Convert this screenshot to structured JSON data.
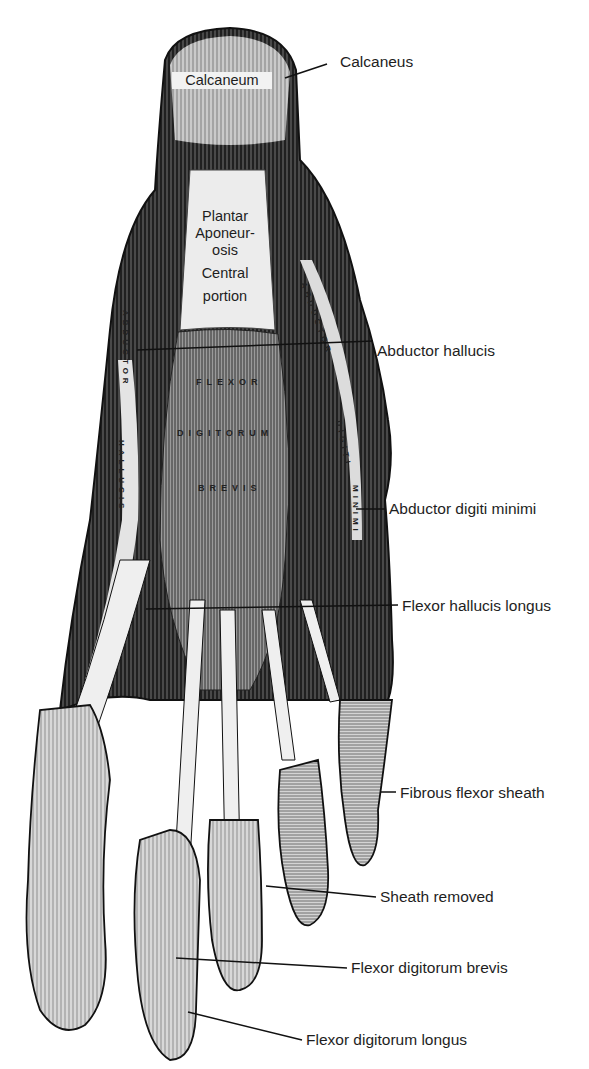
{
  "figure": {
    "style": "monochrome engraving",
    "colors": {
      "ink": "#1a1a1a",
      "paper": "#ffffff",
      "muscle_dark": "#2b2b2b",
      "tendon_light": "#e8e8e8"
    }
  },
  "external_labels": [
    {
      "id": "calcaneus",
      "text": "Calcaneus",
      "x": 380,
      "y": 53,
      "line": [
        [
          285,
          78
        ],
        [
          327,
          64
        ]
      ]
    },
    {
      "id": "abductor-hallucis",
      "text": "Abductor hallucis",
      "x": 377,
      "y": 342,
      "line": [
        [
          137,
          350
        ],
        [
          373,
          341
        ]
      ]
    },
    {
      "id": "abductor-digiti-minimi",
      "text": "Abductor digiti minimi",
      "x": 389,
      "y": 500,
      "line": [
        [
          356,
          509
        ],
        [
          385,
          509
        ]
      ]
    },
    {
      "id": "flexor-hallucis-longus",
      "text": "Flexor hallucis longus",
      "x": 402,
      "y": 597,
      "line": [
        [
          146,
          609
        ],
        [
          398,
          605
        ]
      ]
    },
    {
      "id": "fibrous-flexor-sheath",
      "text": "Fibrous flexor sheath",
      "x": 400,
      "y": 784,
      "line": [
        [
          380,
          792
        ],
        [
          396,
          792
        ]
      ]
    },
    {
      "id": "sheath-removed",
      "text": "Sheath removed",
      "x": 380,
      "y": 888,
      "line": [
        [
          266,
          886
        ],
        [
          376,
          897
        ]
      ]
    },
    {
      "id": "flexor-digitorum-brevis",
      "text": "Flexor digitorum brevis",
      "x": 351,
      "y": 959,
      "line": [
        [
          176,
          958
        ],
        [
          347,
          968
        ]
      ]
    },
    {
      "id": "flexor-digitorum-longus",
      "text": "Flexor digitorum longus",
      "x": 306,
      "y": 1031,
      "line": [
        [
          188,
          1012
        ],
        [
          302,
          1040
        ]
      ]
    }
  ],
  "internal_labels": {
    "calcaneum": "Calcaneum",
    "plantar_aponeurosis": [
      "Plantar",
      "Aponeur-",
      "osis",
      "Central",
      "portion"
    ]
  },
  "muscle_inscriptions": {
    "flexor_digitorum_brevis": [
      "FLEXOR",
      "DIGITORUM",
      "BREVIS"
    ],
    "abductor_hallucis_vertical": [
      "ABDUCTOR",
      "HALLUCIS"
    ],
    "abductor_digiti_vertical": [
      "ABDUCTOR",
      "DIGITI",
      "MINIMI"
    ]
  }
}
